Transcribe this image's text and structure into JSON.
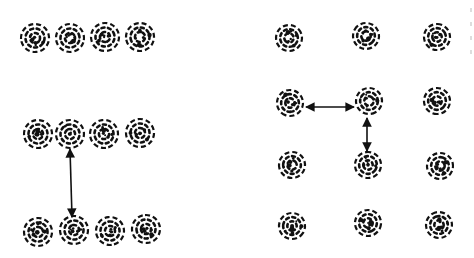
{
  "diagram": {
    "type": "particle-lattice-comparison",
    "color": "#111111",
    "background": "#ffffff",
    "panels": [
      {
        "name": "left-panel",
        "sphere_radius": 14,
        "rows": [
          {
            "spheres": [
              [
                35,
                38
              ],
              [
                70,
                38
              ],
              [
                105,
                37
              ],
              [
                140,
                37
              ]
            ]
          },
          {
            "spheres": [
              [
                38,
                134
              ],
              [
                70,
                134
              ],
              [
                104,
                134
              ],
              [
                140,
                133
              ]
            ]
          },
          {
            "spheres": [
              [
                38,
                232
              ],
              [
                74,
                230
              ],
              [
                110,
                231
              ],
              [
                146,
                229
              ]
            ]
          }
        ],
        "arrows": [
          {
            "direction": "vertical",
            "double_headed": true,
            "from": [
              70,
              149
            ],
            "to": [
              72,
              217
            ]
          }
        ]
      },
      {
        "name": "right-panel",
        "sphere_radius": 13,
        "rows": [
          {
            "spheres": [
              [
                289,
                38
              ],
              [
                366,
                36
              ],
              [
                437,
                37
              ]
            ]
          },
          {
            "spheres": [
              [
                290,
                103
              ],
              [
                369,
                101
              ],
              [
                437,
                101
              ]
            ]
          },
          {
            "spheres": [
              [
                292,
                165
              ],
              [
                368,
                165
              ],
              [
                440,
                166
              ]
            ]
          },
          {
            "spheres": [
              [
                292,
                226
              ],
              [
                368,
                223
              ],
              [
                439,
                225
              ]
            ]
          }
        ],
        "arrows": [
          {
            "direction": "horizontal",
            "double_headed": true,
            "from": [
              306,
              107
            ],
            "to": [
              354,
              107
            ]
          },
          {
            "direction": "vertical",
            "double_headed": true,
            "from": [
              367,
              118
            ],
            "to": [
              367,
              151
            ]
          }
        ]
      }
    ]
  }
}
